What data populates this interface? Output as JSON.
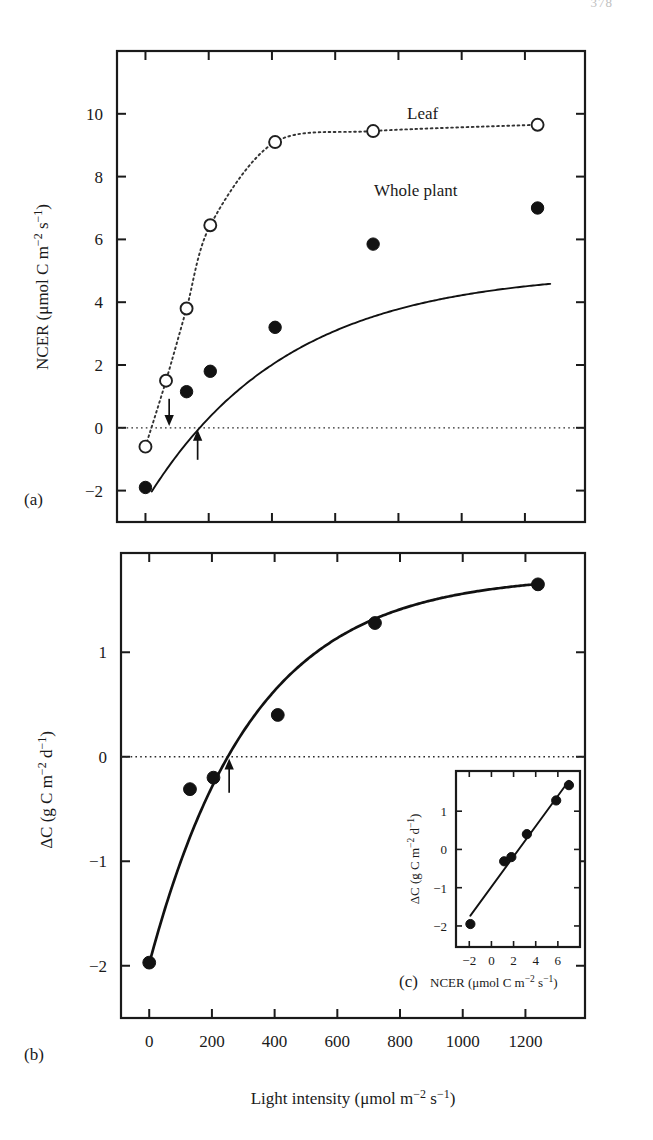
{
  "page": {
    "number": "378"
  },
  "figure": {
    "panels": [
      {
        "id": "panel-a",
        "label": "(a)",
        "ylabel_parts": {
          "prefix": "NCER (μmol C m",
          "sup1": "−2",
          "mid": " s",
          "sup2": "−1",
          "suffix": ")"
        },
        "series_labels": {
          "leaf": "Leaf",
          "whole_plant": "Whole plant"
        },
        "annotations": {
          "leaf_compensation_arrow": "down-arrow-leaf-light-compensation-point",
          "whole_plant_compensation_arrow": "up-arrow-whole-plant-light-compensation-point"
        }
      },
      {
        "id": "panel-b",
        "label": "(b)",
        "ylabel_parts": {
          "prefix": "ΔC (g C m",
          "sup1": "−2",
          "mid": " d",
          "sup2": "−1",
          "suffix": ")"
        },
        "xlabel_parts": {
          "prefix": "Light intensity (μmol m",
          "sup1": "−2",
          "mid": " s",
          "sup2": "−1",
          "suffix": ")"
        },
        "annotations": {
          "compensation_arrow": "up-arrow-daily-carbon-balance-compensation-point"
        }
      },
      {
        "id": "panel-c-inset",
        "label": "(c)",
        "ylabel_parts": {
          "prefix": "ΔC (g C m",
          "sup1": "−2",
          "mid": " d",
          "sup2": "−1",
          "suffix": ")"
        },
        "xlabel_parts": {
          "prefix": "NCER (μmol C m",
          "sup1": "−2",
          "mid": " s",
          "sup2": "−1",
          "suffix": ")"
        }
      }
    ]
  },
  "chart_data": [
    {
      "type": "scatter",
      "id": "a",
      "title": "",
      "xlabel": "Light intensity (μmol m−2 s−1)",
      "ylabel": "NCER (μmol C m−2 s−1)",
      "xlim": [
        -90,
        1390
      ],
      "ylim": [
        -3,
        12
      ],
      "xticks": [
        0,
        200,
        400,
        600,
        800,
        1000,
        1200
      ],
      "xticklabels": [
        "",
        "",
        "",
        "",
        "",
        "",
        ""
      ],
      "yticks": [
        -2,
        0,
        2,
        4,
        6,
        8,
        10
      ],
      "yticklabels": [
        "−2",
        "0",
        "2",
        "4",
        "6",
        "8",
        "10"
      ],
      "grid": false,
      "zero_reference_line": 0,
      "legend_position": "inline-annotation",
      "series": [
        {
          "name": "Leaf",
          "marker": "open-circle",
          "line": "dotted",
          "x": [
            0,
            65,
            130,
            205,
            410,
            720,
            1240
          ],
          "y": [
            -0.6,
            1.5,
            3.8,
            6.45,
            9.1,
            9.45,
            9.65
          ]
        },
        {
          "name": "Whole plant",
          "marker": "filled-circle",
          "line": "solid",
          "x": [
            0,
            130,
            205,
            410,
            720,
            1240
          ],
          "y": [
            -1.9,
            1.15,
            1.8,
            3.2,
            5.85,
            7.0
          ]
        }
      ],
      "annotations": [
        {
          "text": "Leaf",
          "x": 440,
          "y": 10.35
        },
        {
          "text": "Whole plant",
          "x": 430,
          "y": 7.9
        },
        {
          "label": "leaf light compensation point arrow",
          "x": 75,
          "y": 0,
          "direction": "down"
        },
        {
          "label": "whole plant light compensation point arrow",
          "x": 165,
          "y": 0,
          "direction": "up"
        }
      ]
    },
    {
      "type": "scatter",
      "id": "b",
      "title": "",
      "xlabel": "Light intensity (μmol m−2 s−1)",
      "ylabel": "ΔC (g C m−2 d−1)",
      "xlim": [
        -90,
        1390
      ],
      "ylim": [
        -2.5,
        1.95
      ],
      "xticks": [
        0,
        200,
        400,
        600,
        800,
        1000,
        1200
      ],
      "xticklabels": [
        "0",
        "200",
        "400",
        "600",
        "800",
        "1000",
        "1200"
      ],
      "yticks": [
        -2,
        -1,
        0,
        1
      ],
      "yticklabels": [
        "−2",
        "−1",
        "0",
        "1"
      ],
      "grid": false,
      "zero_reference_line": 0,
      "series": [
        {
          "name": "ΔC",
          "marker": "filled-circle",
          "line": "solid",
          "x": [
            0,
            130,
            205,
            410,
            720,
            1240
          ],
          "y": [
            -1.97,
            -0.31,
            -0.2,
            0.4,
            1.28,
            1.65
          ]
        }
      ],
      "annotations": [
        {
          "label": "compensation point arrow",
          "x": 255,
          "y": 0,
          "direction": "up"
        }
      ]
    },
    {
      "type": "scatter",
      "id": "c",
      "title": "",
      "xlabel": "NCER (μmol C m−2 s−1)",
      "ylabel": "ΔC (g C m−2 d−1)",
      "xlim": [
        -3.2,
        8.0
      ],
      "ylim": [
        -2.55,
        2.05
      ],
      "xticks": [
        -2,
        0,
        2,
        4,
        6
      ],
      "xticklabels": [
        "−2",
        "0",
        "2",
        "4",
        "6"
      ],
      "yticks": [
        -2,
        -1,
        0,
        1
      ],
      "yticklabels": [
        "−2",
        "−1",
        "0",
        "1"
      ],
      "grid": false,
      "series": [
        {
          "name": "regression",
          "marker": "filled-circle",
          "line": "solid-linear-fit",
          "x": [
            -1.9,
            1.15,
            1.8,
            3.2,
            5.85,
            7.0
          ],
          "y": [
            -1.95,
            -0.31,
            -0.2,
            0.4,
            1.28,
            1.68
          ]
        }
      ]
    }
  ]
}
